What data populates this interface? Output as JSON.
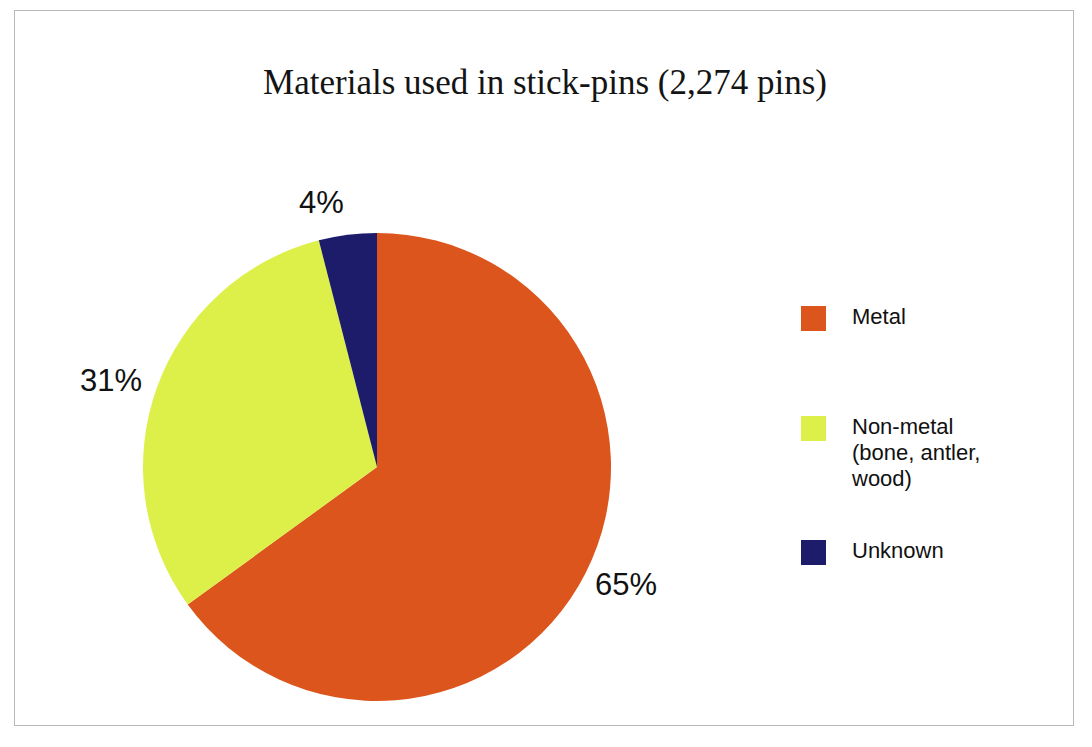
{
  "chart_data": {
    "type": "pie",
    "title": "Materials used in stick-pins (2,274 pins)",
    "categories": [
      "Metal",
      "Non-metal (bone, antler, wood)",
      "Unknown"
    ],
    "values": [
      65,
      31,
      4
    ],
    "value_unit": "percent",
    "total_label": "2,274 pins",
    "total": 2274,
    "data_labels": [
      "65%",
      "31%",
      "4%"
    ],
    "colors": [
      "#dc551c",
      "#ddf04a",
      "#1c1c6b"
    ],
    "legend_position": "right",
    "grid": false,
    "start_angle_deg": 0,
    "direction": "clockwise",
    "xlabel": "",
    "ylabel": ""
  },
  "title": {
    "text": "Materials used in stick-pins (2,274 pins)"
  },
  "pie": {
    "slices": [
      {
        "name": "metal",
        "label": "Metal",
        "percent": 65,
        "data_label": "65%",
        "color": "#dc551c"
      },
      {
        "name": "non-metal",
        "label": "Non-metal",
        "percent": 31,
        "data_label": "31%",
        "color": "#ddf04a"
      },
      {
        "name": "unknown",
        "label": "Unknown",
        "percent": 4,
        "data_label": "4%",
        "color": "#1c1c6b"
      }
    ]
  },
  "legend": {
    "items": [
      {
        "label": "Metal",
        "color": "#dc551c"
      },
      {
        "label": "Non-metal\n(bone, antler,\n wood)",
        "color": "#ddf04a"
      },
      {
        "label": "Unknown",
        "color": "#1c1c6b"
      }
    ]
  },
  "colors": {
    "metal": "#dc551c",
    "non_metal": "#ddf04a",
    "unknown": "#1c1c6b",
    "frame": "#b9b9b9",
    "text": "#111111",
    "background": "#ffffff"
  }
}
